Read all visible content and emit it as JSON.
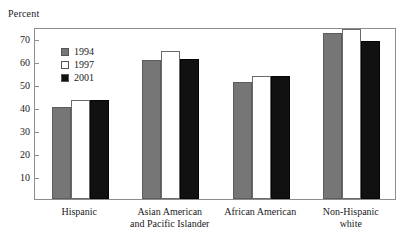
{
  "chart_data": {
    "type": "bar",
    "title": "",
    "ylabel": "Percent",
    "xlabel": "",
    "ylim": [
      0,
      75
    ],
    "yticks": [
      10,
      20,
      30,
      40,
      50,
      60,
      70
    ],
    "grid": false,
    "legend_position": "inside-top-left",
    "categories": [
      "Hispanic",
      "Asian American and Pacific Islander",
      "African American",
      "Non-Hispanic white"
    ],
    "category_lines": [
      [
        "Hispanic",
        ""
      ],
      [
        "Asian American",
        "and Pacific Islander"
      ],
      [
        "African American",
        ""
      ],
      [
        "Non-Hispanic",
        "white"
      ]
    ],
    "series": [
      {
        "name": "1994",
        "color": "#767676",
        "values": [
          40.0,
          60.5,
          51.0,
          72.5
        ]
      },
      {
        "name": "1997",
        "color": "#ffffff",
        "values": [
          43.0,
          64.5,
          53.5,
          74.0
        ]
      },
      {
        "name": "2001",
        "color": "#111111",
        "values": [
          43.0,
          61.0,
          53.5,
          69.0
        ]
      }
    ]
  },
  "axis": {
    "y_title": "Percent"
  }
}
